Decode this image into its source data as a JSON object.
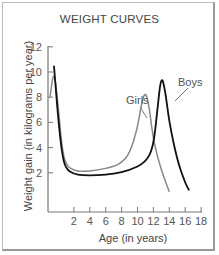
{
  "chart_data": {
    "type": "line",
    "title": "WEIGHT CURVES",
    "xlabel": "Age (in years)",
    "ylabel": "Weight  gain (in kilograms per year)",
    "x_ticks": [
      2,
      4,
      6,
      8,
      10,
      12,
      14,
      16,
      18
    ],
    "y_ticks": [
      2,
      4,
      6,
      8,
      10,
      12
    ],
    "xlim": [
      0,
      18
    ],
    "ylim": [
      0,
      12
    ],
    "grid": false,
    "legend": "inline labels",
    "series": [
      {
        "name": "Girls",
        "color": "#888888",
        "x": [
          0,
          0.5,
          1,
          1.5,
          2,
          3,
          4,
          6,
          8,
          9,
          10,
          11,
          11.5,
          12,
          12.5,
          13,
          14,
          15
        ],
        "y": [
          8,
          10.3,
          7.5,
          4,
          2.6,
          2.2,
          2.1,
          2.2,
          2.5,
          2.8,
          3.5,
          5.5,
          7.5,
          8.5,
          7.2,
          4.5,
          2.2,
          0.5
        ]
      },
      {
        "name": "Boys",
        "color": "#111111",
        "x": [
          0.5,
          1,
          1.5,
          2,
          3,
          4,
          6,
          8,
          10,
          12,
          13,
          13.5,
          14,
          14.5,
          15,
          16,
          17,
          17.5
        ],
        "y": [
          10.5,
          6.5,
          3.5,
          2.3,
          1.9,
          1.8,
          1.8,
          1.9,
          2.2,
          2.8,
          4.0,
          7.0,
          9.8,
          8.5,
          6.0,
          3.0,
          1.2,
          0.6
        ]
      }
    ]
  },
  "labels": {
    "girls": "Girls",
    "boys": "Boys"
  }
}
